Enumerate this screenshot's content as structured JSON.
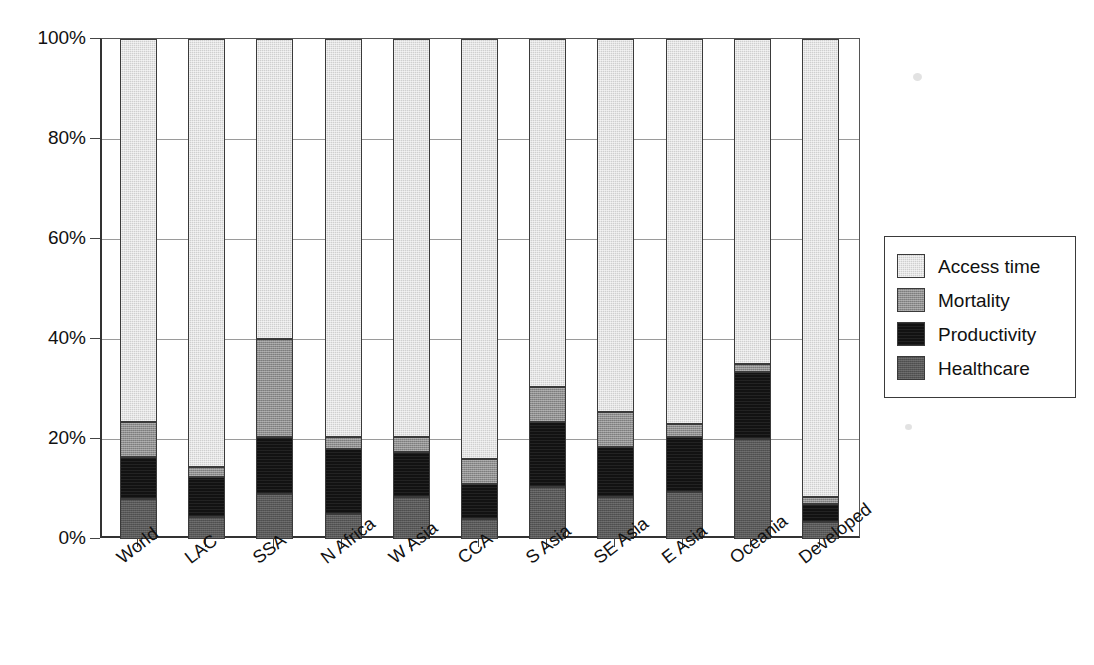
{
  "chart_data": {
    "type": "bar",
    "subtype": "stacked-percentage",
    "title": "",
    "xlabel": "",
    "ylabel": "",
    "ylim": [
      0,
      100
    ],
    "y_tick_labels": [
      "100%",
      "80%",
      "60%",
      "40%",
      "20%",
      "0%"
    ],
    "y_ticks": [
      100,
      80,
      60,
      40,
      20,
      0
    ],
    "grid": true,
    "grid_axis": "y",
    "legend_position": "right",
    "categories": [
      "World",
      "LAC",
      "SSA",
      "N Africa",
      "W Asia",
      "CCA",
      "S Asia",
      "SE Asia",
      "E Asia",
      "Oceania",
      "Developed"
    ],
    "series": [
      {
        "name": "Healthcare",
        "color": "#575757",
        "values": [
          8.0,
          4.5,
          9.0,
          5.0,
          8.5,
          4.0,
          10.5,
          8.5,
          9.5,
          20.0,
          3.5
        ]
      },
      {
        "name": "Productivity",
        "color": "#121212",
        "values": [
          8.5,
          8.0,
          11.5,
          13.0,
          9.0,
          7.0,
          13.0,
          10.0,
          11.0,
          13.5,
          3.5
        ]
      },
      {
        "name": "Mortality",
        "color": "#8e8e8e",
        "values": [
          7.0,
          2.0,
          19.5,
          2.5,
          3.0,
          5.0,
          7.0,
          7.0,
          2.5,
          1.5,
          1.5
        ]
      },
      {
        "name": "Access time",
        "color": "#cfcfcf",
        "values": [
          76.5,
          85.5,
          60.0,
          79.5,
          79.5,
          84.0,
          69.5,
          74.5,
          77.0,
          65.0,
          91.5
        ]
      }
    ],
    "stack_order_bottom_to_top": [
      "Healthcare",
      "Productivity",
      "Mortality",
      "Access time"
    ]
  },
  "legend": {
    "items": [
      {
        "label": "Access time",
        "swatch": "access"
      },
      {
        "label": "Mortality",
        "swatch": "mortality"
      },
      {
        "label": "Productivity",
        "swatch": "productivity"
      },
      {
        "label": "Healthcare",
        "swatch": "healthcare"
      }
    ]
  }
}
